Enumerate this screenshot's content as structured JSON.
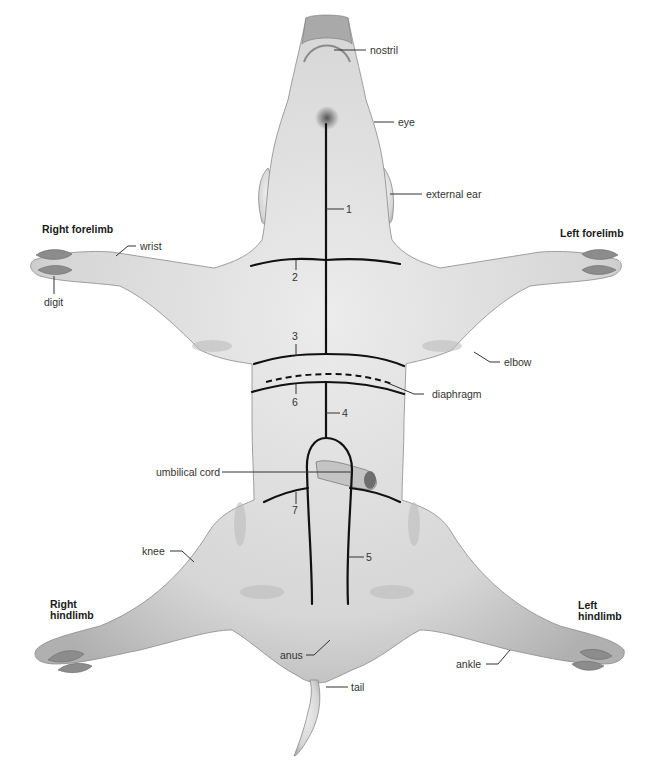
{
  "diagram": {
    "colors": {
      "background": "#ffffff",
      "skin": "#dcdcdc",
      "skin_shadow": "#a8a8a8",
      "incision_line": "#111111",
      "label_text": "#333333"
    },
    "region_labels": {
      "right_forelimb": "Right forelimb",
      "left_forelimb": "Left forelimb",
      "right_hindlimb_line1": "Right",
      "right_hindlimb_line2": "hindlimb",
      "left_hindlimb_line1": "Left",
      "left_hindlimb_line2": "hindlimb"
    },
    "anatomy_labels": {
      "nostril": "nostril",
      "eye": "eye",
      "external_ear": "external ear",
      "wrist": "wrist",
      "digit": "digit",
      "elbow": "elbow",
      "diaphragm": "diaphragm",
      "umbilical_cord": "umbilical cord",
      "knee": "knee",
      "anus": "anus",
      "tail": "tail",
      "ankle": "ankle"
    },
    "incisions": [
      {
        "number": "1",
        "description": "midline incision from throat to chest"
      },
      {
        "number": "2",
        "description": "transverse incision across upper chest"
      },
      {
        "number": "3",
        "description": "transverse incision anterior to diaphragm"
      },
      {
        "number": "4",
        "description": "midline incision from diaphragm to umbilical cord"
      },
      {
        "number": "5",
        "description": "paired incisions around umbilical cord to posterior"
      },
      {
        "number": "6",
        "description": "transverse incision posterior to diaphragm"
      },
      {
        "number": "7",
        "description": "transverse incision at hindlimbs"
      }
    ]
  }
}
